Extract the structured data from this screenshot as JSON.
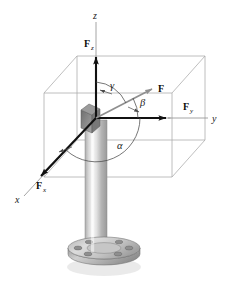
{
  "figure": {
    "background_color": "#ffffff"
  },
  "axes": {
    "z": {
      "label": "z",
      "icon": "axis-arrow-up"
    },
    "y": {
      "label": "y",
      "icon": "axis-line-right"
    },
    "x": {
      "label": "x",
      "icon": "axis-line-lower-left"
    }
  },
  "vectors": [
    {
      "key": "F",
      "label": "F",
      "subscript": "",
      "icon": "bold-arrow-diagonal",
      "color": "#8c8c8c"
    },
    {
      "key": "Fz",
      "label": "F",
      "subscript": "z",
      "icon": "bold-arrow-up",
      "color": "#111111"
    },
    {
      "key": "Fy",
      "label": "F",
      "subscript": "y",
      "icon": "bold-arrow-right",
      "color": "#111111"
    },
    {
      "key": "Fx",
      "label": "F",
      "subscript": "x",
      "icon": "bold-arrow-down-left",
      "color": "#111111"
    }
  ],
  "angles": [
    {
      "key": "gamma",
      "label": "γ",
      "between": "z-axis and F"
    },
    {
      "key": "beta",
      "label": "β",
      "between": "y-axis and F"
    },
    {
      "key": "alpha",
      "label": "α",
      "between": "x-axis and F"
    }
  ],
  "objects": {
    "box": {
      "name": "reference-box",
      "stroke": "#a9a9a9"
    },
    "post": {
      "name": "vertical-post",
      "fill_light": "#f2f2f2",
      "fill_dark": "#9e9e9e"
    },
    "flange": {
      "name": "base-flange",
      "fill": "#b8b8b8",
      "bolt_count": 6
    },
    "origin_block": {
      "name": "origin-block",
      "fill": "#8f8f8f"
    }
  },
  "colors": {
    "vector_black": "#111111",
    "vector_gray": "#8c8c8c",
    "box_gray": "#a9a9a9",
    "text": "#1a1a1a"
  }
}
